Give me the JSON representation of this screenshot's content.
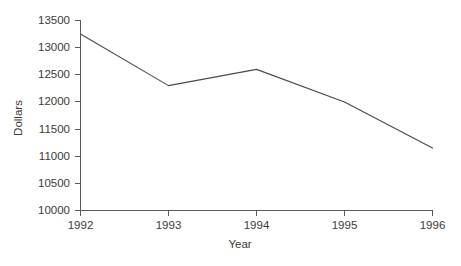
{
  "chart_data": {
    "type": "line",
    "title": "",
    "xlabel": "Year",
    "ylabel": "Dollars",
    "categories": [
      "1992",
      "1993",
      "1994",
      "1995",
      "1996"
    ],
    "x": [
      1992,
      1993,
      1994,
      1995,
      1996
    ],
    "values": [
      13250,
      12300,
      12600,
      12000,
      11150
    ],
    "series": [
      {
        "name": "Dollars",
        "values": [
          13250,
          12300,
          12600,
          12000,
          11150
        ]
      }
    ],
    "ylim": [
      10000,
      13500
    ],
    "xlim": [
      1992,
      1996
    ],
    "yticks": [
      10000,
      10500,
      11000,
      11500,
      12000,
      12500,
      13000,
      13500
    ],
    "ytick_labels": [
      "10000",
      "10500",
      "11000",
      "11500",
      "12000",
      "12500",
      "13000",
      "13500"
    ],
    "xticks": [
      1992,
      1993,
      1994,
      1995,
      1996
    ],
    "xtick_labels": [
      "1992",
      "1993",
      "1994",
      "1995",
      "1996"
    ],
    "grid": false,
    "legend": false,
    "legend_position": "none",
    "line_color": "#4a4a4a",
    "axis_color": "#5a5a5a",
    "text_color": "#3a3a3a",
    "background_color": "#ffffff",
    "annotations": []
  },
  "axes": {
    "y_title": "Dollars",
    "x_title": "Year"
  }
}
